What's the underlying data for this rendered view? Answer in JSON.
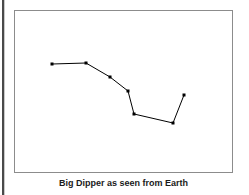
{
  "figure": {
    "caption": "Big Dipper as seen from Earth",
    "frame": {
      "x": 14,
      "y": 10,
      "width": 219,
      "height": 163,
      "border_color": "#8c8c8c",
      "background_color": "#ffffff"
    },
    "page_edge_color": "#4a4a4a"
  },
  "chart_data": {
    "type": "scatter",
    "title": "Big Dipper as seen from Earth",
    "subtitle": "",
    "xlabel": "",
    "ylabel": "",
    "grid": false,
    "legend": null,
    "axis_visible": false,
    "xlim": [
      14,
      233
    ],
    "ylim": [
      10,
      173
    ],
    "marker_color": "#000000",
    "line_color": "#000000",
    "marker_size": 3,
    "line_width": 1,
    "points": [
      {
        "name": "Alkaid",
        "x": 52,
        "y": 64
      },
      {
        "name": "Mizar",
        "x": 86,
        "y": 63
      },
      {
        "name": "Alioth",
        "x": 110,
        "y": 77
      },
      {
        "name": "Megrez",
        "x": 128,
        "y": 91
      },
      {
        "name": "Phecda",
        "x": 134,
        "y": 114
      },
      {
        "name": "Merak",
        "x": 173,
        "y": 123
      },
      {
        "name": "Dubhe",
        "x": 184,
        "y": 95
      }
    ],
    "connections": [
      [
        0,
        1
      ],
      [
        1,
        2
      ],
      [
        2,
        3
      ],
      [
        3,
        4
      ],
      [
        4,
        5
      ],
      [
        5,
        6
      ]
    ]
  }
}
